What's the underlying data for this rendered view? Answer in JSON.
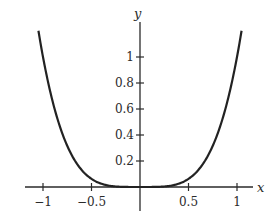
{
  "chart_data": {
    "type": "line",
    "title": "",
    "function": "y = x^4",
    "xlabel": "x",
    "ylabel": "y",
    "xlim": [
      -1.15,
      1.15
    ],
    "ylim": [
      0,
      1.25
    ],
    "grid": false,
    "legend": null,
    "x_ticks": [
      -1,
      -0.5,
      0.5,
      1
    ],
    "x_tick_labels": [
      "−1",
      "−0.5",
      "0.5",
      "1"
    ],
    "y_ticks": [
      0.2,
      0.4,
      0.6,
      0.8,
      1
    ],
    "y_tick_labels": [
      "0.2",
      "0.4",
      "0.6",
      "0.8",
      "1"
    ],
    "series": [
      {
        "name": "x^4",
        "color": "#222222",
        "x": [
          -1.047,
          -1.0,
          -0.9,
          -0.8,
          -0.7,
          -0.6,
          -0.5,
          -0.4,
          -0.3,
          -0.2,
          -0.1,
          0,
          0.1,
          0.2,
          0.3,
          0.4,
          0.5,
          0.6,
          0.7,
          0.8,
          0.9,
          1.0,
          1.047
        ],
        "y": [
          1.2,
          1.0,
          0.656,
          0.41,
          0.24,
          0.13,
          0.0625,
          0.0256,
          0.0081,
          0.0016,
          0.0001,
          0,
          0.0001,
          0.0016,
          0.0081,
          0.0256,
          0.0625,
          0.13,
          0.24,
          0.41,
          0.656,
          1.0,
          1.2
        ]
      }
    ]
  }
}
